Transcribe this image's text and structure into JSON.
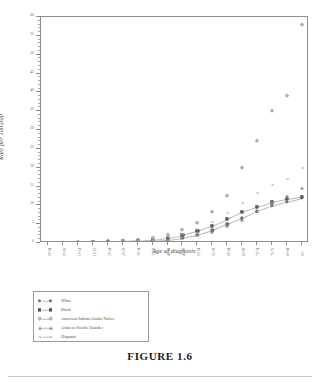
{
  "caption": "FIGURE 1.6",
  "chart_data": {
    "type": "scatter",
    "title": "",
    "xlabel": "Age at diagnosis",
    "ylabel": "Rate per 100,000",
    "ylim": [
      0,
      60
    ],
    "yticks": [
      0,
      5,
      10,
      15,
      20,
      25,
      30,
      35,
      40,
      45,
      50,
      55,
      60
    ],
    "ytick_labels": [
      "0",
      "5",
      "10",
      "15",
      "20",
      "25",
      "30",
      "35",
      "40",
      "45",
      "50",
      "55",
      "60"
    ],
    "grid": false,
    "legend_position": "below-left",
    "categories": [
      "00-04",
      "05-09",
      "10-14",
      "15-19",
      "20-24",
      "25-29",
      "30-34",
      "35-39",
      "40-44",
      "45-49",
      "50-54",
      "55-59",
      "60-64",
      "65-69",
      "70-74",
      "75-79",
      "80-84",
      "85+"
    ],
    "series": [
      {
        "name": "White",
        "marker": "circle",
        "values": [
          0.1,
          0.1,
          0.1,
          0.2,
          0.2,
          0.3,
          0.4,
          0.6,
          0.9,
          1.4,
          2.2,
          3.4,
          5.0,
          6.6,
          8.4,
          9.8,
          11.0,
          12.0
        ]
      },
      {
        "name": "Black",
        "marker": "square",
        "values": [
          0.1,
          0.1,
          0.1,
          0.2,
          0.3,
          0.4,
          0.6,
          0.9,
          1.4,
          2.1,
          3.2,
          4.6,
          6.3,
          8.2,
          9.6,
          10.8,
          11.6,
          12.2
        ]
      },
      {
        "name": "American Indian/Alaska Native",
        "marker": "diamond-open",
        "values": [
          0.1,
          0.1,
          0.2,
          0.3,
          0.4,
          0.6,
          0.9,
          1.3,
          2.1,
          3.4,
          5.4,
          8.3,
          12.6,
          19.8,
          27.1,
          35.0,
          39.0,
          58.0
        ]
      },
      {
        "name": "Asian or Pacific Islander",
        "marker": "triangle",
        "values": [
          0.1,
          0.1,
          0.1,
          0.2,
          0.2,
          0.3,
          0.4,
          0.6,
          0.9,
          1.3,
          2.0,
          3.0,
          4.4,
          6.2,
          8.6,
          10.6,
          12.5,
          14.6
        ]
      },
      {
        "name": "Hispanic",
        "marker": "triangle-left",
        "values": [
          0.1,
          0.1,
          0.1,
          0.2,
          0.3,
          0.4,
          0.6,
          0.9,
          1.5,
          2.4,
          3.8,
          5.6,
          8.0,
          10.6,
          13.2,
          15.4,
          17.0,
          19.8
        ]
      }
    ]
  }
}
